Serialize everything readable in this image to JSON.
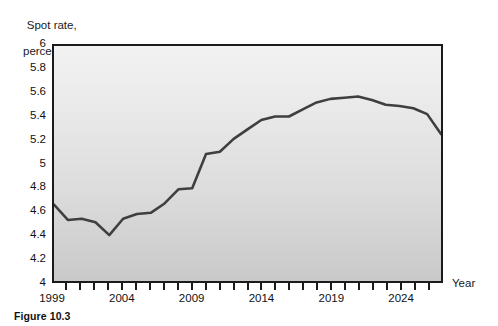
{
  "figure": {
    "caption": "Figure 10.3"
  },
  "chart_data": {
    "type": "line",
    "title": "",
    "ylabel": "Spot rate,\npercent",
    "ylabel_line1": "Spot rate,",
    "ylabel_line2": "percent",
    "xlabel": "Year",
    "ylim": [
      4,
      6
    ],
    "xlim": [
      1999,
      2027
    ],
    "grid": false,
    "legend": null,
    "line_color": "#3f3f3f",
    "plot_background": "#e4e4e4",
    "frame_color": "#1b1b1b",
    "yticks": [
      4,
      4.2,
      4.4,
      4.6,
      4.8,
      5,
      5.2,
      5.4,
      5.6,
      5.8,
      6
    ],
    "ytick_labels": [
      "4",
      "4.2",
      "4.4",
      "4.6",
      "4.8",
      "5",
      "5.2",
      "5.4",
      "5.6",
      "5.8",
      "6"
    ],
    "xticks": [
      1999,
      2000,
      2001,
      2002,
      2003,
      2004,
      2005,
      2006,
      2007,
      2008,
      2009,
      2010,
      2011,
      2012,
      2013,
      2014,
      2015,
      2016,
      2017,
      2018,
      2019,
      2020,
      2021,
      2022,
      2023,
      2024,
      2025,
      2026,
      2027
    ],
    "xtick_labels_shown": [
      "1999",
      "2004",
      "2009",
      "2014",
      "2019",
      "2024"
    ],
    "xtick_labels_shown_at": [
      1999,
      2004,
      2009,
      2014,
      2019,
      2024
    ],
    "series": [
      {
        "name": "Spot rate",
        "x": [
          1999,
          2000,
          2001,
          2002,
          2003,
          2004,
          2005,
          2006,
          2007,
          2008,
          2009,
          2010,
          2011,
          2012,
          2013,
          2014,
          2015,
          2016,
          2017,
          2018,
          2019,
          2020,
          2021,
          2022,
          2023,
          2024,
          2025,
          2026,
          2027
        ],
        "values": [
          4.65,
          4.52,
          4.53,
          4.5,
          4.39,
          4.53,
          4.57,
          4.58,
          4.66,
          4.78,
          4.79,
          5.08,
          5.1,
          5.21,
          5.29,
          5.37,
          5.4,
          5.4,
          5.46,
          5.52,
          5.55,
          5.56,
          5.57,
          5.54,
          5.5,
          5.49,
          5.47,
          5.42,
          5.25
        ]
      }
    ]
  }
}
